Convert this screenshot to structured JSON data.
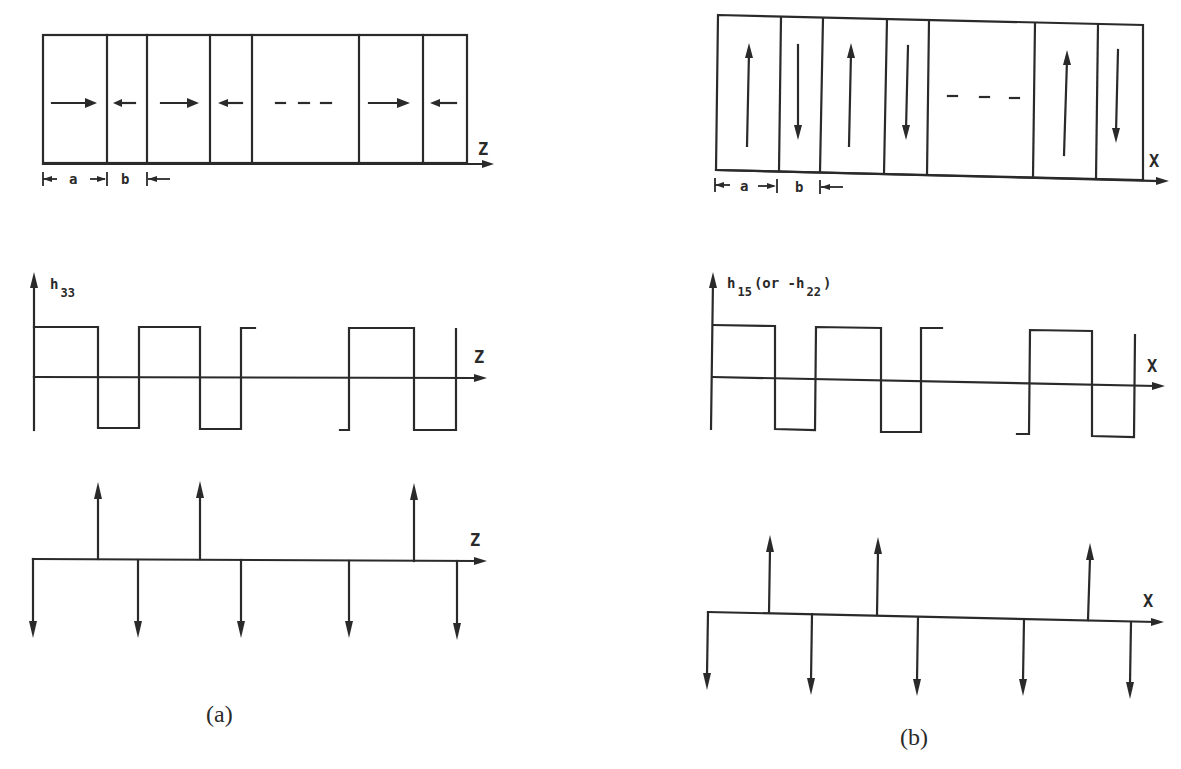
{
  "figure": {
    "panels": [
      {
        "id": "a",
        "caption": "(a)",
        "domain_structure": {
          "axis_label": "Z",
          "polarization_directions": [
            "right",
            "left",
            "right",
            "left",
            "ellipsis",
            "right",
            "left"
          ],
          "ellipsis": "- - -",
          "dimension_labels": {
            "a": "a",
            "b": "b"
          }
        },
        "coefficient_plot": {
          "y_label_main": "h",
          "y_label_sub": "33",
          "x_label": "Z",
          "waveform": "square"
        },
        "delta_plot": {
          "x_label": "Z",
          "up_arrows": 3,
          "down_arrows": 5
        }
      },
      {
        "id": "b",
        "caption": "(b)",
        "domain_structure": {
          "axis_label": "X",
          "polarization_directions": [
            "up",
            "down",
            "up",
            "down",
            "ellipsis",
            "up",
            "down"
          ],
          "ellipsis": "- - -",
          "dimension_labels": {
            "a": "a",
            "b": "b"
          }
        },
        "coefficient_plot": {
          "y_label_main": "h",
          "y_label_sub": "15",
          "y_label_paren_open": "(or -h",
          "y_label_paren_sub": "22",
          "y_label_paren_close": ")",
          "x_label": "X",
          "waveform": "square"
        },
        "delta_plot": {
          "x_label": "X",
          "up_arrows": 3,
          "down_arrows": 5
        }
      }
    ]
  }
}
